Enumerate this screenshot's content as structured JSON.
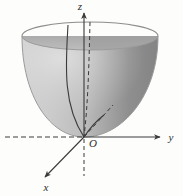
{
  "figure": {
    "kind": "3d-math-diagram",
    "background_color": "#fdfdfc"
  },
  "axes": {
    "z": {
      "label": "z",
      "direction": "up",
      "positive_style": "solid",
      "negative_style": "dashed",
      "has_arrow": true,
      "color": "#3a3a3a"
    },
    "y": {
      "label": "y",
      "direction": "right",
      "positive_style": "solid",
      "negative_style": "dashed",
      "has_arrow": true,
      "color": "#3a3a3a"
    },
    "x": {
      "label": "x",
      "direction": "down-left",
      "positive_style": "solid",
      "negative_style": "none",
      "has_arrow": true,
      "color": "#3a3a3a"
    }
  },
  "origin": {
    "label": "O",
    "x": 84,
    "y": 137
  },
  "surface": {
    "name": "paraboloid",
    "rim_center_x": 90,
    "rim_center_y": 36,
    "rim_radius_x": 68,
    "rim_radius_y": 14,
    "vertex_x": 84,
    "vertex_y": 137,
    "outer_light_color": "#c9c9c9",
    "outer_dark_color": "#8c8c8c",
    "interior_color": "#a5a5a5",
    "rim_edge_color": "#8f8f8f",
    "outline_color": "#9a9a9a"
  },
  "curves": [
    {
      "name": "solid-parabola-cross-section",
      "style": "solid",
      "color": "#3b3b3b"
    },
    {
      "name": "dashed-parabola-cross-section",
      "style": "dashed",
      "color": "#3b3b3b"
    },
    {
      "name": "dashed-radial-ray",
      "style": "dashed",
      "color": "#3b3b3b"
    }
  ]
}
